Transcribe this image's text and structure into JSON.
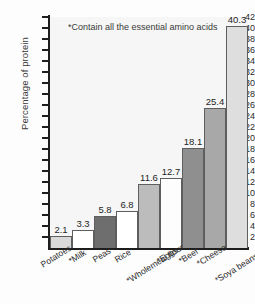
{
  "chart_data": {
    "type": "bar",
    "title": "",
    "xlabel": "",
    "ylabel": "Percentage of protein",
    "ylim": [
      0,
      42
    ],
    "ytick_step": 2,
    "grid": false,
    "legend": "none",
    "annotation": "*Contain all the essential amino acids",
    "categories": [
      "Potatoes",
      "*Milk",
      "Peas",
      "Rice",
      "*Wholemeal flour",
      "*Eggs",
      "*Beef",
      "*Cheese",
      "*Soya beans"
    ],
    "values": [
      2.1,
      3.3,
      5.8,
      6.8,
      11.6,
      12.7,
      18.1,
      25.4,
      40.3
    ],
    "value_labels": [
      "2.1",
      "3.3",
      "5.8",
      "6.8",
      "11.6",
      "12.7",
      "18.1",
      "25.4",
      "40.3"
    ],
    "bar_colors": [
      "#d9d9d9",
      "#ffffff",
      "#6e6e6e",
      "#ffffff",
      "#bcbcbc",
      "#fdfdfd",
      "#8f8f8f",
      "#a8a8a8",
      "#dedede"
    ],
    "ytick_labels": [
      "42",
      "40",
      "38",
      "36",
      "34",
      "32",
      "30",
      "28",
      "26",
      "24",
      "22",
      "20",
      "18",
      "16",
      "14",
      "12",
      "10",
      "8",
      "6",
      "4",
      "2"
    ],
    "ytick_values": [
      42,
      40,
      38,
      36,
      34,
      32,
      30,
      28,
      26,
      24,
      22,
      20,
      18,
      16,
      14,
      12,
      10,
      8,
      6,
      4,
      2
    ],
    "axis_color": "#1e1e1e",
    "plot_background": "#f6f6f6",
    "bar_border_color": "#5e5e5e"
  }
}
